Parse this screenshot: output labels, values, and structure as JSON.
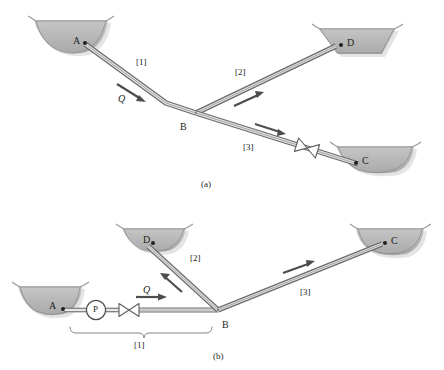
{
  "figure": {
    "colors": {
      "reservoir_fill": "#b9b9b9",
      "reservoir_stroke": "#8c8c8c",
      "pipe_stroke": "#6e6e6e",
      "pipe_fill": "#d6d6d6",
      "arrow": "#4d4d4d",
      "text": "#231f20",
      "shadow": "#cfcfcf"
    },
    "panels": [
      {
        "id": "a",
        "caption": "(a)",
        "reservoirs": [
          {
            "name": "A",
            "label": "A",
            "label_side": "left"
          },
          {
            "name": "D",
            "label": "D",
            "label_side": "right"
          },
          {
            "name": "C",
            "label": "C",
            "label_side": "right"
          }
        ],
        "junction": {
          "name": "B",
          "label": "B"
        },
        "pipes": [
          {
            "id": "1",
            "label": "[1]",
            "from": "A",
            "to": "B",
            "flow_label": "Q",
            "flow_direction": "A-to-B",
            "has_valve": false
          },
          {
            "id": "2",
            "label": "[2]",
            "from": "B",
            "to": "D",
            "flow_label": "",
            "flow_direction": "B-to-D",
            "has_valve": false
          },
          {
            "id": "3",
            "label": "[3]",
            "from": "B",
            "to": "C",
            "flow_label": "",
            "flow_direction": "B-to-C",
            "has_valve": true
          }
        ],
        "components": [
          {
            "type": "valve",
            "on_pipe": "3"
          }
        ]
      },
      {
        "id": "b",
        "caption": "(b)",
        "reservoirs": [
          {
            "name": "A",
            "label": "A",
            "label_side": "left"
          },
          {
            "name": "D",
            "label": "D",
            "label_side": "left"
          },
          {
            "name": "C",
            "label": "C",
            "label_side": "right"
          }
        ],
        "junction": {
          "name": "B",
          "label": "B"
        },
        "pipes": [
          {
            "id": "1",
            "label": "[1]",
            "from": "A",
            "to": "B",
            "flow_label": "Q",
            "flow_direction": "A-to-B",
            "has_valve": true,
            "has_pump": true,
            "has_brace": true
          },
          {
            "id": "2",
            "label": "[2]",
            "from": "B",
            "to": "D",
            "flow_label": "",
            "flow_direction": "B-to-D",
            "has_valve": false
          },
          {
            "id": "3",
            "label": "[3]",
            "from": "B",
            "to": "C",
            "flow_label": "",
            "flow_direction": "B-to-C",
            "has_valve": false
          }
        ],
        "components": [
          {
            "type": "pump",
            "label": "P",
            "on_pipe": "1"
          },
          {
            "type": "valve",
            "on_pipe": "1"
          }
        ]
      }
    ]
  },
  "labels": {
    "a": {
      "res_a": "A",
      "res_d": "D",
      "res_c": "C",
      "junction_b": "B",
      "pipe1": "[1]",
      "pipe2": "[2]",
      "pipe3": "[3]",
      "flow_q": "Q",
      "caption": "(a)"
    },
    "b": {
      "res_a": "A",
      "res_d": "D",
      "res_c": "C",
      "junction_b": "B",
      "pipe1": "[1]",
      "pipe2": "[2]",
      "pipe3": "[3]",
      "flow_q": "Q",
      "pump": "P",
      "caption": "(b)"
    }
  }
}
